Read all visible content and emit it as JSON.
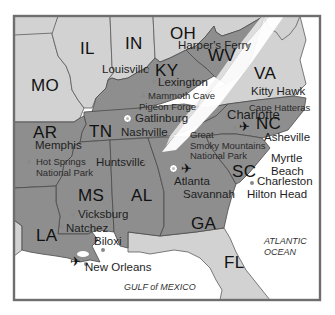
{
  "map": {
    "colors": {
      "highlight_states": "#8c8c8c",
      "other_states": "#cfcfcf",
      "water": "#ffffff",
      "border": "#5a5a5a",
      "frame": "#6e6e6e",
      "snow_band": "#ffffff"
    },
    "states": {
      "MO": "MO",
      "IL": "IL",
      "IN": "IN",
      "OH": "OH",
      "KY": "KY",
      "WV": "WV",
      "VA": "VA",
      "TN": "TN",
      "NC": "NC",
      "AR": "AR",
      "MS": "MS",
      "AL": "AL",
      "GA": "GA",
      "SC": "SC",
      "LA": "LA",
      "FL": "FL"
    },
    "cities": {
      "louisville": "Louisville",
      "harpers_ferry": "Harper's Ferry",
      "lexington": "Lexington",
      "mammoth_cave": "Mammoth Cave",
      "pigeon_forge": "Pigeon Forge",
      "kitty_hawk": "Kitty Hawk",
      "cape_hatteras": "Cape Hatteras",
      "gatlinburg": "Gatlinburg",
      "nashville": "Nashville",
      "charlotte": "Charlotte",
      "memphis": "Memphis",
      "hot_springs": "Hot Springs",
      "hot_springs_2": "National Park",
      "great_smoky_1": "Great",
      "great_smoky_2": "Smoky Mountains",
      "great_smoky_3": "National Park",
      "asheville": "Asheville",
      "huntsville": "Huntsville",
      "myrtle_beach_1": "Myrtle",
      "myrtle_beach_2": "Beach",
      "atlanta": "Atlanta",
      "charleston": "Charleston",
      "savannah": "Savannah",
      "hilton_head": "Hilton Head",
      "vicksburg": "Vicksburg",
      "natchez": "Natchez",
      "biloxi": "Biloxi",
      "new_orleans": "New Orleans"
    },
    "water_bodies": {
      "atlantic_1": "ATLANTIC",
      "atlantic_2": "OCEAN",
      "gulf": "GULF of MEXICO"
    },
    "icons": {
      "airport": "✈"
    }
  }
}
